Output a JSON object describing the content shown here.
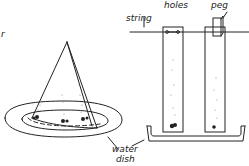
{
  "labels": {
    "cut_left": "r",
    "string": "string",
    "holes": "holes",
    "peg": "peg",
    "water_dish_line1": "water",
    "water_dish_line2": "dish"
  },
  "colors": {
    "ink": "#222222",
    "paper": "#ffffff"
  }
}
